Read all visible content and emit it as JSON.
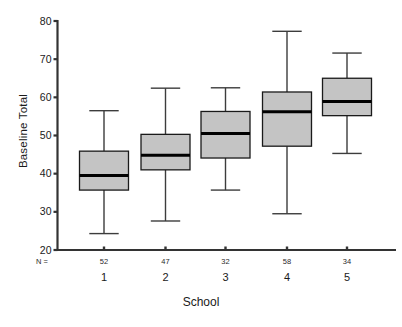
{
  "chart_data": {
    "type": "box",
    "title": "",
    "xlabel": "School",
    "ylabel": "Baseline Total",
    "ylim": [
      20,
      80
    ],
    "yticks": [
      20,
      30,
      40,
      50,
      60,
      70,
      80
    ],
    "ytick_labels": [
      "20",
      "30",
      "40",
      "50",
      "60",
      "70",
      "80"
    ],
    "grid": false,
    "legend": "none",
    "n_prefix": "N =",
    "categories": [
      "1",
      "2",
      "3",
      "4",
      "5"
    ],
    "counts": [
      52,
      47,
      32,
      58,
      34
    ],
    "count_labels": [
      "52",
      "47",
      "32",
      "58",
      "34"
    ],
    "boxes": [
      {
        "category": "1",
        "n": 52,
        "whisker_low": 24.3,
        "q1": 35.7,
        "median": 39.5,
        "q3": 45.9,
        "whisker_high": 56.5
      },
      {
        "category": "2",
        "n": 47,
        "whisker_low": 27.6,
        "q1": 41.0,
        "median": 44.8,
        "q3": 50.3,
        "whisker_high": 62.4
      },
      {
        "category": "3",
        "n": 32,
        "whisker_low": 35.7,
        "q1": 44.1,
        "median": 50.5,
        "q3": 56.3,
        "whisker_high": 62.5
      },
      {
        "category": "4",
        "n": 58,
        "whisker_low": 29.5,
        "q1": 47.2,
        "median": 56.2,
        "q3": 61.4,
        "whisker_high": 77.3
      },
      {
        "category": "5",
        "n": 34,
        "whisker_low": 45.3,
        "q1": 55.2,
        "median": 58.9,
        "q3": 65.0,
        "whisker_high": 71.6
      }
    ],
    "colors": {
      "box_fill": "#c4c4c4",
      "box_stroke": "#1a1a1a",
      "median": "#000000",
      "whisker": "#3c3c3c",
      "axis": "#333333",
      "background": "#ffffff"
    }
  }
}
